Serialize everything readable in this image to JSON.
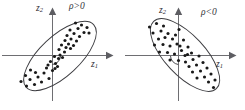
{
  "figure": {
    "background_color": "#ffffff",
    "point_color": "#191919",
    "axis_color": "#6e6e72",
    "ellipse_color": "#3d3d41"
  },
  "panels": [
    {
      "id": "positive",
      "rho_label": "ρ>0",
      "x_axis_label": "z",
      "x_axis_subscript": "1",
      "y_axis_label": "z",
      "y_axis_subscript": "2",
      "correlation_sign": "positive",
      "ellipse": {
        "center_x": 60,
        "center_y": 56,
        "rx": 46,
        "ry": 20,
        "rotation_deg": -43
      },
      "points": [
        [
          30.5,
          70.0
        ],
        [
          25.5,
          75.5
        ],
        [
          35.5,
          72.5
        ],
        [
          21.0,
          81.5
        ],
        [
          30.0,
          79.5
        ],
        [
          38.0,
          77.0
        ],
        [
          44.0,
          73.0
        ],
        [
          26.5,
          86.0
        ],
        [
          34.5,
          84.5
        ],
        [
          41.5,
          82.0
        ],
        [
          49.0,
          78.5
        ],
        [
          46.5,
          68.0
        ],
        [
          52.5,
          70.5
        ],
        [
          55.5,
          63.5
        ],
        [
          57.5,
          66.5
        ],
        [
          50.5,
          61.5
        ],
        [
          58.5,
          58.5
        ],
        [
          54.5,
          56.5
        ],
        [
          60.0,
          55.0
        ],
        [
          62.5,
          57.5
        ],
        [
          64.5,
          52.0
        ],
        [
          59.0,
          49.5
        ],
        [
          66.0,
          47.5
        ],
        [
          61.5,
          45.0
        ],
        [
          68.5,
          44.0
        ],
        [
          70.5,
          48.5
        ],
        [
          73.5,
          45.5
        ],
        [
          65.0,
          40.5
        ],
        [
          71.0,
          39.0
        ],
        [
          76.5,
          41.0
        ],
        [
          67.0,
          35.5
        ],
        [
          74.0,
          33.5
        ],
        [
          79.5,
          36.5
        ],
        [
          70.0,
          30.0
        ],
        [
          78.0,
          28.5
        ],
        [
          84.0,
          32.5
        ],
        [
          81.5,
          25.0
        ],
        [
          87.0,
          27.5
        ],
        [
          75.5,
          23.0
        ],
        [
          89.0,
          33.0
        ],
        [
          55.0,
          68.5
        ],
        [
          48.0,
          65.0
        ]
      ]
    },
    {
      "id": "negative",
      "rho_label": "ρ<0",
      "x_axis_label": "z",
      "x_axis_subscript": "1",
      "y_axis_label": "z",
      "y_axis_subscript": "2",
      "correlation_sign": "negative",
      "ellipse": {
        "center_x": 62,
        "center_y": 55,
        "rx": 46,
        "ry": 20,
        "rotation_deg": 47
      },
      "points": [
        [
          26.5,
          27.0
        ],
        [
          33.5,
          23.5
        ],
        [
          40.5,
          26.0
        ],
        [
          30.0,
          33.0
        ],
        [
          38.0,
          31.0
        ],
        [
          45.0,
          33.5
        ],
        [
          35.5,
          39.0
        ],
        [
          42.0,
          37.5
        ],
        [
          49.5,
          39.0
        ],
        [
          56.0,
          29.5
        ],
        [
          52.5,
          35.0
        ],
        [
          31.5,
          45.0
        ],
        [
          40.0,
          44.5
        ],
        [
          47.0,
          46.0
        ],
        [
          54.0,
          44.0
        ],
        [
          60.5,
          40.0
        ],
        [
          36.5,
          52.0
        ],
        [
          44.5,
          52.5
        ],
        [
          51.5,
          54.0
        ],
        [
          58.5,
          50.5
        ],
        [
          65.0,
          47.0
        ],
        [
          62.0,
          55.5
        ],
        [
          64.5,
          54.5
        ],
        [
          68.5,
          53.0
        ],
        [
          55.5,
          60.5
        ],
        [
          62.5,
          62.0
        ],
        [
          70.0,
          59.5
        ],
        [
          76.0,
          56.0
        ],
        [
          66.0,
          66.5
        ],
        [
          73.5,
          65.0
        ],
        [
          80.0,
          62.5
        ],
        [
          69.5,
          72.0
        ],
        [
          77.5,
          71.0
        ],
        [
          84.0,
          68.0
        ],
        [
          74.0,
          78.0
        ],
        [
          81.5,
          77.0
        ],
        [
          88.0,
          74.0
        ],
        [
          85.5,
          82.0
        ],
        [
          92.0,
          80.0
        ],
        [
          90.5,
          87.5
        ],
        [
          47.0,
          60.0
        ],
        [
          57.0,
          46.0
        ]
      ]
    }
  ]
}
